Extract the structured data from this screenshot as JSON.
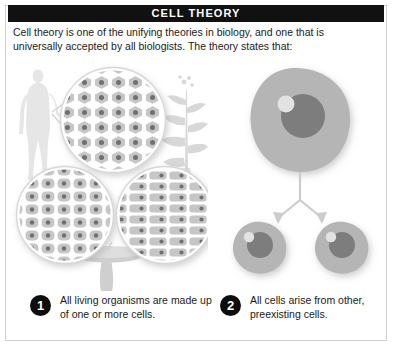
{
  "header": {
    "title": "CELL THEORY",
    "bar_color": "#111111",
    "title_color": "#ffffff"
  },
  "intro": {
    "text": "Cell theory is one of the unifying theories in biology, and one that is universally accepted by all biologists. The theory states that:"
  },
  "statements": [
    {
      "number": "1",
      "text": "All living organisms are made up of one or more cells."
    },
    {
      "number": "2",
      "text": "All cells arise from other, preexisting cells."
    }
  ],
  "illustration": {
    "left_panel": {
      "name": "organisms-magnified-cells",
      "elements": [
        "human-silhouette",
        "plant-silhouette",
        "mushroom-silhouette",
        "magnified-circle-animal-cells",
        "magnified-circle-fungal-cells",
        "magnified-circle-plant-cells"
      ]
    },
    "right_panel": {
      "name": "cell-division",
      "elements": [
        "parent-cell",
        "division-arrows",
        "daughter-cell-left",
        "daughter-cell-right"
      ]
    }
  },
  "colors": {
    "frame_border": "#cfcfcf",
    "page_background": "#ffffff",
    "text": "#1a1a1a",
    "badge_background": "#0d0d0d",
    "badge_text": "#ffffff",
    "cell_body": "#b3b3b3",
    "cell_nucleus": "#7d7d7d",
    "cell_highlight": "#e0e0e0",
    "silhouette": "#e4e4e4",
    "magnifier_cell_fill": "#c4c4c4",
    "magnifier_nucleus": "#6f6f6f"
  }
}
